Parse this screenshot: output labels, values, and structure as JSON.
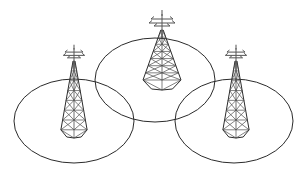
{
  "figure": {
    "width": 308,
    "height": 172,
    "background_color": "#ffffff",
    "line_color": "#2b2b2b",
    "lattice_color": "#4a4a4a",
    "antenna_color": "#555555",
    "stroke_width": 1
  },
  "cells": [
    {
      "name": "left-coverage-cell",
      "label": "",
      "cx": 74,
      "cy": 121,
      "rx": 60,
      "ry": 42
    },
    {
      "name": "center-coverage-cell",
      "label": "",
      "cx": 155,
      "cy": 80,
      "rx": 60,
      "ry": 42
    },
    {
      "name": "right-coverage-cell",
      "label": "",
      "cx": 234,
      "cy": 121,
      "rx": 59,
      "ry": 42
    }
  ],
  "towers": [
    {
      "name": "left-tower",
      "label": "",
      "x": 74,
      "top_y": 48,
      "base_y": 138,
      "half_width_base": 16,
      "scale": 0.82,
      "levels": 7
    },
    {
      "name": "center-tower",
      "label": "",
      "x": 162,
      "top_y": 14,
      "base_y": 90,
      "half_width_base": 19,
      "scale": 1.0,
      "levels": 7
    },
    {
      "name": "right-tower",
      "label": "",
      "x": 236,
      "top_y": 48,
      "base_y": 138,
      "half_width_base": 16,
      "scale": 0.82,
      "levels": 7
    }
  ],
  "antenna": {
    "name": "antenna-array",
    "mast_height": 16,
    "arms": [
      {
        "y_offset": 5,
        "half_len": 11
      },
      {
        "y_offset": 9,
        "half_len": 13
      },
      {
        "y_offset": 12,
        "half_len": 8
      }
    ]
  }
}
